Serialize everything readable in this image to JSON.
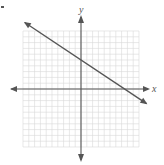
{
  "problem": {
    "marker": "."
  },
  "chart_data": {
    "type": "line",
    "title": "",
    "xlabel": "x",
    "ylabel": "y",
    "xlim": [
      -10,
      10
    ],
    "ylim": [
      -10,
      10
    ],
    "grid": true,
    "grid_step": 1,
    "axes_arrows": true,
    "series": [
      {
        "name": "line",
        "equation": "y = -2/3 x + 5",
        "slope": -0.6667,
        "y_intercept": 5,
        "x_intercept": 7.5,
        "arrows_both_ends": true,
        "points": [
          [
            -10,
            11.67
          ],
          [
            10,
            -1.67
          ]
        ]
      }
    ],
    "colors": {
      "line": "#555555",
      "axes": "#555555",
      "grid": "#d9d9d9"
    }
  }
}
